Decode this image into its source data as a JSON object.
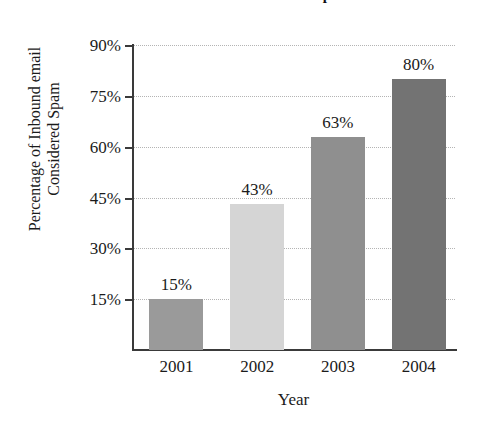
{
  "chart_data": {
    "type": "bar",
    "title": "email in the U.S. Considered Spam",
    "xlabel": "Year",
    "ylabel": "Percentage of Inbound email Considered Spam",
    "ylabel_lines": [
      "Percentage of Inbound email",
      "Considered Spam"
    ],
    "categories": [
      "2001",
      "2002",
      "2003",
      "2004"
    ],
    "values": [
      15,
      43,
      63,
      80
    ],
    "value_labels": [
      "15%",
      "43%",
      "63%",
      "80%"
    ],
    "ylim": [
      0,
      90
    ],
    "yticks": [
      15,
      30,
      45,
      60,
      75,
      90
    ],
    "ytick_labels": [
      "15%",
      "30%",
      "45%",
      "60%",
      "75%",
      "90%"
    ],
    "grid": true,
    "legend": null,
    "bar_colors": [
      "#9a9a9a",
      "#d5d5d5",
      "#8f8f8f",
      "#737373"
    ]
  },
  "colors": {
    "background": "#ffffff",
    "axis": "#3a3a3a",
    "gridline": "#b4b4b4",
    "text": "#1b1b1b"
  }
}
